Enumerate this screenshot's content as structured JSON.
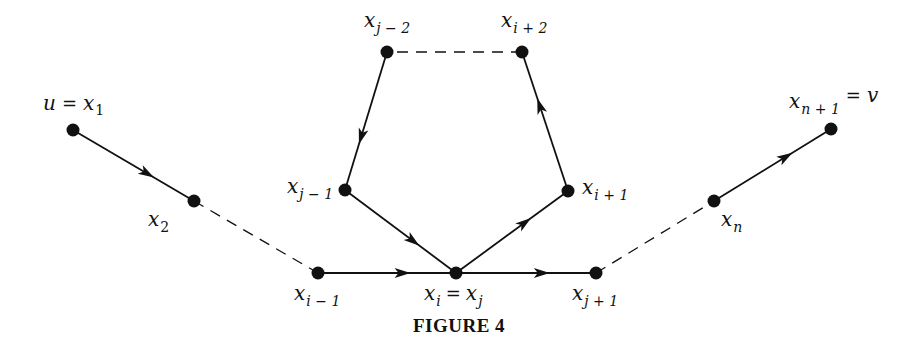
{
  "figure": {
    "caption": "FIGURE 4"
  },
  "nodes": [
    {
      "id": "x1",
      "x": 73,
      "y": 130,
      "label_main": "u",
      "label_eq": "=",
      "label_var": "x",
      "label_sub": "1",
      "label_pos": "above"
    },
    {
      "id": "x2",
      "x": 194,
      "y": 201,
      "label_var": "x",
      "label_sub": "2",
      "label_pos": "below-left"
    },
    {
      "id": "xi_minus_1",
      "x": 318,
      "y": 273,
      "label_var": "x",
      "label_sub": "i − 1",
      "label_pos": "below"
    },
    {
      "id": "xi_eq_xj",
      "x": 456,
      "y": 273,
      "label_var": "x",
      "label_sub": "i",
      "label_eq": "=",
      "label_var2": "x",
      "label_sub2": "j",
      "label_pos": "below"
    },
    {
      "id": "xj_plus_1",
      "x": 596,
      "y": 273,
      "label_var": "x",
      "label_sub": "j + 1",
      "label_pos": "below"
    },
    {
      "id": "xj_minus_1",
      "x": 345,
      "y": 190,
      "label_var": "x",
      "label_sub": "j − 1",
      "label_pos": "left"
    },
    {
      "id": "xj_minus_2",
      "x": 387,
      "y": 52,
      "label_var": "x",
      "label_sub": "j − 2",
      "label_pos": "above"
    },
    {
      "id": "xi_plus_2",
      "x": 522,
      "y": 52,
      "label_var": "x",
      "label_sub": "i + 2",
      "label_pos": "above"
    },
    {
      "id": "xi_plus_1",
      "x": 568,
      "y": 191,
      "label_var": "x",
      "label_sub": "i + 1",
      "label_pos": "right"
    },
    {
      "id": "xn",
      "x": 714,
      "y": 201,
      "label_var": "x",
      "label_sub": "n",
      "label_pos": "below"
    },
    {
      "id": "xn_plus_1",
      "x": 831,
      "y": 129,
      "label_var": "x",
      "label_sub": "n + 1",
      "label_eq": "=",
      "label_main": "v",
      "label_pos": "above"
    }
  ],
  "edges": [
    {
      "from": "x1",
      "to": "x2",
      "style": "solid",
      "directed": true
    },
    {
      "from": "x2",
      "to": "xi_minus_1",
      "style": "dashed",
      "directed": false
    },
    {
      "from": "xi_minus_1",
      "to": "xi_eq_xj",
      "style": "solid",
      "directed": true
    },
    {
      "from": "xi_eq_xj",
      "to": "xj_plus_1",
      "style": "solid",
      "directed": true
    },
    {
      "from": "xj_plus_1",
      "to": "xn",
      "style": "dashed",
      "directed": false
    },
    {
      "from": "xn",
      "to": "xn_plus_1",
      "style": "solid",
      "directed": true
    },
    {
      "from": "xi_eq_xj",
      "to": "xi_plus_1",
      "style": "solid",
      "directed": true
    },
    {
      "from": "xi_plus_1",
      "to": "xi_plus_2",
      "style": "solid",
      "directed": true
    },
    {
      "from": "xi_plus_2",
      "to": "xj_minus_2",
      "style": "dashed",
      "directed": false
    },
    {
      "from": "xj_minus_2",
      "to": "xj_minus_1",
      "style": "solid",
      "directed": true
    },
    {
      "from": "xj_minus_1",
      "to": "xi_eq_xj",
      "style": "solid",
      "directed": true
    }
  ],
  "labels": {
    "x1": {
      "u": "u",
      "eq": "=",
      "x": "x",
      "sub": "1"
    },
    "x2": {
      "x": "x",
      "sub": "2"
    },
    "xi_minus_1": {
      "x": "x",
      "sub": "i − 1"
    },
    "xi_eq_xj": {
      "x": "x",
      "sub": "i",
      "eq": "=",
      "x2": "x",
      "sub2": "j"
    },
    "xj_plus_1": {
      "x": "x",
      "sub": "j + 1"
    },
    "xj_minus_1": {
      "x": "x",
      "sub": "j − 1"
    },
    "xj_minus_2": {
      "x": "x",
      "sub": "j − 2"
    },
    "xi_plus_2": {
      "x": "x",
      "sub": "i + 2"
    },
    "xi_plus_1": {
      "x": "x",
      "sub": "i + 1"
    },
    "xn": {
      "x": "x",
      "sub": "n"
    },
    "xn_plus_1": {
      "x": "x",
      "sub": "n + 1",
      "eq": "=",
      "v": "v"
    }
  },
  "colors": {
    "ink": "#111111",
    "background": "#ffffff"
  }
}
